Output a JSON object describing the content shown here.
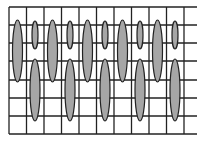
{
  "diagram": {
    "type": "grid-with-ellipses",
    "colors": {
      "background": "#ffffff",
      "grid_line": "#222222",
      "ellipse_fill": "#a6a6a6",
      "ellipse_stroke": "#222222"
    },
    "grid": {
      "left": 9,
      "top": 7,
      "right": 197,
      "bottom": 134,
      "vertical_x": [
        9,
        26.5,
        44,
        61.5,
        79,
        96.5,
        114,
        131.5,
        149,
        166.5,
        184
      ],
      "horizontal_y": [
        7,
        25,
        43,
        61,
        80,
        98,
        116,
        134
      ]
    },
    "ellipses": [
      {
        "cx": 17.5,
        "cy": 51,
        "rx": 5,
        "ry": 31
      },
      {
        "cx": 35,
        "cy": 35,
        "rx": 3,
        "ry": 14
      },
      {
        "cx": 35,
        "cy": 90,
        "rx": 5,
        "ry": 31
      },
      {
        "cx": 52.5,
        "cy": 51,
        "rx": 5,
        "ry": 31
      },
      {
        "cx": 70,
        "cy": 35,
        "rx": 3,
        "ry": 14
      },
      {
        "cx": 70,
        "cy": 90,
        "rx": 5,
        "ry": 31
      },
      {
        "cx": 87.5,
        "cy": 51,
        "rx": 5,
        "ry": 31
      },
      {
        "cx": 105,
        "cy": 35,
        "rx": 3,
        "ry": 14
      },
      {
        "cx": 105,
        "cy": 90,
        "rx": 5,
        "ry": 31
      },
      {
        "cx": 122.5,
        "cy": 51,
        "rx": 5,
        "ry": 31
      },
      {
        "cx": 140,
        "cy": 35,
        "rx": 3,
        "ry": 14
      },
      {
        "cx": 140,
        "cy": 90,
        "rx": 5,
        "ry": 31
      },
      {
        "cx": 157.5,
        "cy": 51,
        "rx": 5,
        "ry": 31
      },
      {
        "cx": 175,
        "cy": 35,
        "rx": 3,
        "ry": 14
      },
      {
        "cx": 175,
        "cy": 90,
        "rx": 5,
        "ry": 31
      }
    ]
  }
}
